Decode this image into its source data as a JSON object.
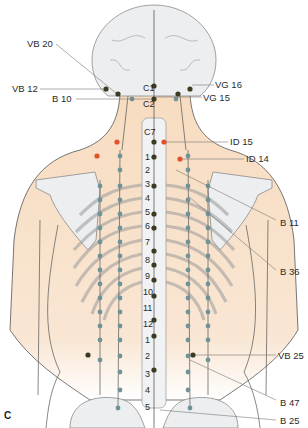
{
  "figure": {
    "panel_label": "C",
    "colors": {
      "skin": "#f7dcc0",
      "bone": "#eceef0",
      "bone_outline": "#8a8a8a",
      "meridian_point": "#6f9398",
      "key_point": "#3d3a22",
      "red_point": "#e2522a",
      "leader_line": "#777777"
    },
    "labels": {
      "left": [
        {
          "id": "VB20",
          "text": "VB 20"
        },
        {
          "id": "VB12",
          "text": "VB 12"
        },
        {
          "id": "B10",
          "text": "B 10"
        }
      ],
      "right": [
        {
          "id": "VG16",
          "text": "VG 16"
        },
        {
          "id": "VG15",
          "text": "VG 15"
        },
        {
          "id": "ID15",
          "text": "ID 15"
        },
        {
          "id": "ID14",
          "text": "ID 14"
        },
        {
          "id": "B11",
          "text": "B 11"
        },
        {
          "id": "B36",
          "text": "B 36"
        },
        {
          "id": "VB25",
          "text": "VB 25"
        },
        {
          "id": "B47",
          "text": "B 47"
        },
        {
          "id": "B25",
          "text": "B 25"
        }
      ]
    },
    "vertebrae": {
      "cervical": [
        "C1",
        "C2",
        "C7"
      ],
      "thoracic": [
        "1",
        "2",
        "3",
        "4",
        "5",
        "6",
        "7",
        "8",
        "9",
        "10",
        "11",
        "12"
      ],
      "lumbar": [
        "1",
        "2",
        "3",
        "4",
        "5"
      ]
    }
  }
}
